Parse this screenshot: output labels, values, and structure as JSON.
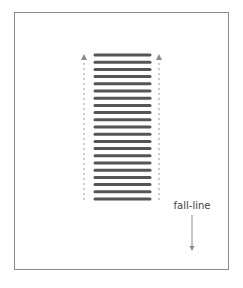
{
  "diagram": {
    "label": "fall-line",
    "stripe_count": 21,
    "stripe_color": "#555555",
    "guide_color": "#9a9a9a",
    "frame_color": "#8a8a8a",
    "arrows": {
      "guides": "up",
      "fall_line": "down"
    }
  }
}
